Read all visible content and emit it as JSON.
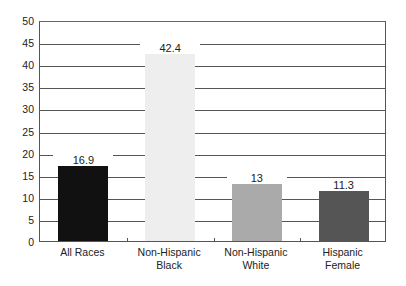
{
  "chart_data": {
    "type": "bar",
    "title": "",
    "xlabel": "",
    "ylabel": "",
    "ylim": [
      0,
      50
    ],
    "yticks": [
      0,
      5,
      10,
      15,
      20,
      25,
      30,
      35,
      40,
      45,
      50
    ],
    "grid": true,
    "categories": [
      "All Races",
      "Non-Hispanic Black",
      "Non-Hispanic White",
      "Hispanic Female"
    ],
    "category_lines": [
      [
        "All Races"
      ],
      [
        "Non-Hispanic",
        "Black"
      ],
      [
        "Non-Hispanic",
        "White"
      ],
      [
        "Hispanic",
        "Female"
      ]
    ],
    "values": [
      16.9,
      42.4,
      13,
      11.3
    ],
    "value_labels": [
      "16.9",
      "42.4",
      "13",
      "11.3"
    ],
    "colors": [
      "#111111",
      "#eeeeee",
      "#aaaaaa",
      "#555555"
    ]
  }
}
